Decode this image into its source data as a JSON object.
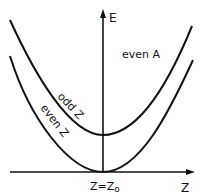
{
  "diagram": {
    "type": "energy-curves",
    "axes": {
      "y_label": "E",
      "x_label": "Z",
      "x_tick_label": "Z = Z₀",
      "x_tick_main": "Z=Z",
      "x_tick_sub": "o"
    },
    "region_label": "even A",
    "curves": [
      {
        "name": "odd Z",
        "label": "odd Z",
        "minimum_y_px": 135
      },
      {
        "name": "even Z",
        "label": "even Z",
        "minimum_y_px": 172
      }
    ],
    "colors": {
      "line": "#111111",
      "background": "#ffffff"
    }
  }
}
